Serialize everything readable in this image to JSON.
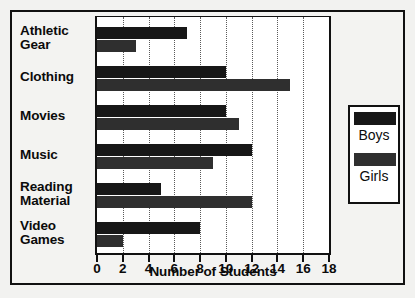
{
  "chart_data": {
    "type": "bar",
    "orientation": "horizontal",
    "title": "",
    "xlabel": "Number of Students",
    "ylabel": "",
    "xlim": [
      0,
      18
    ],
    "xticks": [
      0,
      2,
      4,
      6,
      8,
      10,
      12,
      14,
      16,
      18
    ],
    "xtick_labels": [
      "0",
      "2",
      "4",
      "6",
      "8",
      "10",
      "12",
      "14",
      "16",
      "18"
    ],
    "grid": "vertical-dotted",
    "legend_position": "right",
    "categories": [
      "Athletic Gear",
      "Clothing",
      "Movies",
      "Music",
      "Reading Material",
      "Video Games"
    ],
    "category_lines": [
      [
        "Athletic",
        "Gear"
      ],
      [
        "Clothing"
      ],
      [
        "Movies"
      ],
      [
        "Music"
      ],
      [
        "Reading",
        "Material"
      ],
      [
        "Video",
        "Games"
      ]
    ],
    "series": [
      {
        "name": "Boys",
        "color": "#171717",
        "values": [
          7,
          10,
          10,
          12,
          5,
          8
        ]
      },
      {
        "name": "Girls",
        "color": "#2f2f2f",
        "values": [
          3,
          15,
          11,
          9,
          12,
          2
        ]
      }
    ]
  },
  "legend": {
    "items": [
      {
        "label": "Boys",
        "swatch": "boys"
      },
      {
        "label": "Girls",
        "swatch": "girls"
      }
    ]
  },
  "colors": {
    "boys": "#171717",
    "girls": "#2f2f2f",
    "frame": "#111111",
    "plot_background": "#ffffff",
    "page_background": "#f2f2f0"
  }
}
